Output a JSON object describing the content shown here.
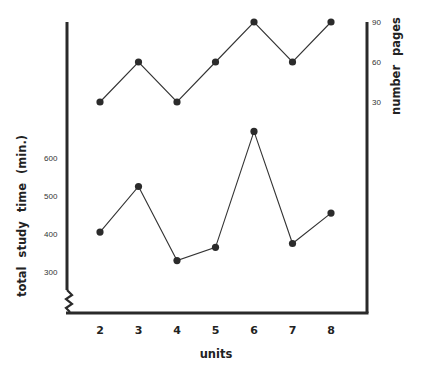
{
  "chart_data": {
    "type": "line",
    "title": "",
    "xlabel": "units",
    "ylabel_left": "total study time (min.)",
    "ylabel_right": "number pages",
    "categories": [
      2,
      3,
      4,
      5,
      6,
      7,
      8
    ],
    "x_tick_labels": [
      "2",
      "3",
      "4",
      "5",
      "6",
      "7",
      "8"
    ],
    "left_axis": {
      "ticks": [
        300,
        400,
        500,
        600
      ],
      "tick_labels": [
        "300",
        "400",
        "500",
        "600"
      ],
      "broken_axis": true
    },
    "right_axis": {
      "ticks": [
        30,
        60,
        90
      ],
      "tick_labels": [
        "30",
        "60",
        "90"
      ]
    },
    "series": [
      {
        "name": "number pages",
        "axis": "right",
        "values": [
          30,
          60,
          30,
          60,
          90,
          60,
          90
        ]
      },
      {
        "name": "total study time (min.)",
        "axis": "left",
        "values": [
          405,
          525,
          330,
          365,
          670,
          375,
          455
        ]
      }
    ],
    "grid": false,
    "legend": "none"
  },
  "colors": {
    "axis": "#2a2a2a",
    "line": "#333333",
    "marker": "#2b2b2b",
    "background": "#ffffff"
  }
}
